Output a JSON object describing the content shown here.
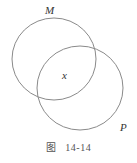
{
  "figure": {
    "caption_prefix": "图",
    "caption_number": "14-14"
  },
  "sets": [
    {
      "label": "M",
      "cx": 54,
      "cy": 59,
      "rx": 42,
      "ry": 41
    },
    {
      "label": "P",
      "cx": 80,
      "cy": 88,
      "rx": 43,
      "ry": 42
    }
  ],
  "intersection_label": "x",
  "colors": {
    "stroke": "#8a8a8a",
    "text": "#333333"
  }
}
